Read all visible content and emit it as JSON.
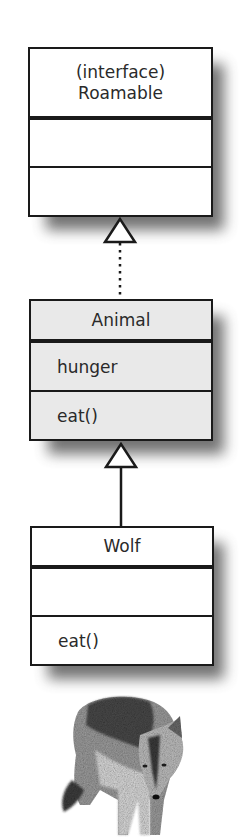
{
  "diagram": {
    "type": "uml-class-hierarchy",
    "classes": [
      {
        "id": "roamable",
        "stereotype": "(interface)",
        "name": "Roamable",
        "attributes": [],
        "methods": [],
        "fill": "#ffffff"
      },
      {
        "id": "animal",
        "name": "Animal",
        "attributes": [
          "hunger"
        ],
        "methods": [
          "eat()"
        ],
        "fill": "#e9e9e9"
      },
      {
        "id": "wolf",
        "name": "Wolf",
        "attributes": [],
        "methods": [
          "eat()"
        ],
        "fill": "#ffffff"
      }
    ],
    "relations": [
      {
        "from": "animal",
        "to": "roamable",
        "kind": "realization",
        "line": "dotted",
        "arrowhead": "hollow-triangle"
      },
      {
        "from": "wolf",
        "to": "animal",
        "kind": "generalization",
        "line": "solid",
        "arrowhead": "hollow-triangle"
      }
    ],
    "illustration": {
      "subject": "wolf-photo",
      "style": "grayscale"
    }
  }
}
